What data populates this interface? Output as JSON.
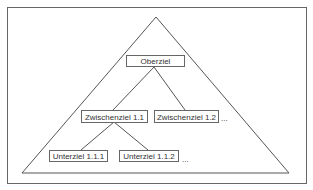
{
  "diagram": {
    "type": "goal-hierarchy-pyramid",
    "colors": {
      "line": "#555555",
      "text": "#333333",
      "background": "#ffffff"
    },
    "nodes": {
      "root": {
        "label": "Oberziel"
      },
      "mid1": {
        "label": "Zwischenziel 1.1"
      },
      "mid2": {
        "label": "Zwischenziel 1.2"
      },
      "mid_more": {
        "label": "..."
      },
      "leaf1": {
        "label": "Unterziel 1.1.1"
      },
      "leaf2": {
        "label": "Unterziel 1.1.2"
      },
      "leaf_more": {
        "label": "..."
      }
    },
    "edges": [
      [
        "Oberziel",
        "Zwischenziel 1.1"
      ],
      [
        "Oberziel",
        "Zwischenziel 1.2"
      ],
      [
        "Zwischenziel 1.1",
        "Unterziel 1.1.1"
      ],
      [
        "Zwischenziel 1.1",
        "Unterziel 1.1.2"
      ]
    ]
  }
}
